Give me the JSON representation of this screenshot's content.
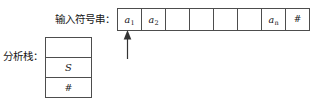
{
  "diagram": {
    "colors": {
      "border": "#4d4d4d",
      "text": "#161616",
      "background": "#ffffff"
    }
  },
  "input": {
    "label": "输入符号串：",
    "pointer_icon": "up-arrow-icon",
    "pointer_target_index": 0,
    "cells": [
      {
        "text": "a",
        "sub": "1",
        "kind": "symbol"
      },
      {
        "text": "a",
        "sub": "2",
        "kind": "symbol"
      },
      {
        "text": "",
        "sub": "",
        "kind": "empty"
      },
      {
        "text": "",
        "sub": "",
        "kind": "empty"
      },
      {
        "text": "",
        "sub": "",
        "kind": "empty"
      },
      {
        "text": "",
        "sub": "",
        "kind": "empty"
      },
      {
        "text": "a",
        "sub": "n",
        "kind": "symbol"
      },
      {
        "text": "#",
        "sub": "",
        "kind": "end-marker"
      }
    ]
  },
  "stack": {
    "label": "分析栈：",
    "cells": [
      {
        "text": "",
        "kind": "empty"
      },
      {
        "text": "S",
        "kind": "symbol"
      },
      {
        "text": "#",
        "kind": "end-marker"
      }
    ]
  }
}
